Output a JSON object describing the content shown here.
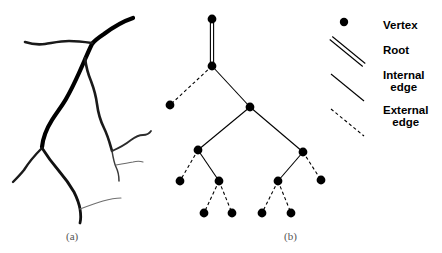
{
  "figure": {
    "panels": [
      {
        "id": "a",
        "label": "(a)",
        "caption_x": 78,
        "caption_y": 237,
        "content": "river-network-drawing"
      },
      {
        "id": "b",
        "label": "(b)",
        "caption_x": 296,
        "caption_y": 237,
        "content": "tree-diagram"
      }
    ]
  },
  "colors": {
    "ink": "#000000",
    "thin_ink": "#2b2b2b",
    "faint_ink": "#7a7a7a",
    "background": "#ffffff",
    "caption": "#555555"
  },
  "panel_a": {
    "name": "river-network",
    "strokes": [
      {
        "name": "main-trunk",
        "width": 4.2,
        "color": "#000000",
        "path": "M 133 18 C 124 21, 112 28, 104 34 C 98 38, 94 41, 92 44 C 88 52, 84 62, 79 73 C 74 84, 70 92, 66 99 C 62 106, 57 112, 52 120 C 47 128, 43 137, 42 147"
      },
      {
        "name": "upper-left-branch",
        "width": 2.6,
        "color": "#1a1a1a",
        "path": "M 92 43 C 85 42, 77 41, 69 41 C 60 41, 52 43, 45 44 C 38 45, 31 44, 25 42"
      },
      {
        "name": "right-secondary-branch",
        "width": 2.6,
        "color": "#1a1a1a",
        "path": "M 85 58 C 86 66, 88 74, 91 81 C 94 89, 96 96, 97 104 C 98 112, 100 120, 104 128 C 108 136, 110 144, 112 151"
      },
      {
        "name": "right-upper-twig",
        "width": 1.8,
        "color": "#2b2b2b",
        "path": "M 112 151 C 119 148, 126 144, 131 140 C 135 137, 139 135, 143 135 C 146 135, 149 134, 151 131"
      },
      {
        "name": "right-lower-twig",
        "width": 1.5,
        "color": "#3a3a3a",
        "path": "M 112 151 C 113 157, 114 163, 116 167 C 118 171, 119 176, 119 181"
      },
      {
        "name": "right-fine-twig",
        "width": 1.1,
        "color": "#6a6a6a",
        "path": "M 116 165 C 122 164, 128 163, 133 162 C 137 161, 140 161, 143 162"
      },
      {
        "name": "lower-left-branch",
        "width": 2.4,
        "color": "#1a1a1a",
        "path": "M 42 148 C 36 154, 29 162, 24 170 C 20 175, 16 179, 13 182"
      },
      {
        "name": "lower-main-stem",
        "width": 2.8,
        "color": "#111111",
        "path": "M 42 148 C 47 156, 53 164, 59 171 C 65 178, 70 185, 74 192 C 77 198, 79 203, 80 209 C 81 215, 81 219, 80 223"
      },
      {
        "name": "bottom-fine-twig",
        "width": 1.1,
        "color": "#6f6f6f",
        "path": "M 80 209 C 88 206, 96 203, 103 201 C 110 199, 116 198, 121 198"
      }
    ]
  },
  "panel_b": {
    "name": "tree-diagram",
    "vertex_radius": 4.4,
    "vertices": [
      {
        "id": "v0",
        "x": 212,
        "y": 19,
        "name": "root-top-vertex"
      },
      {
        "id": "v1",
        "x": 212,
        "y": 66,
        "name": "root-base-vertex"
      },
      {
        "id": "v2",
        "x": 170,
        "y": 105,
        "name": "external-leaf-left-top"
      },
      {
        "id": "v3",
        "x": 250,
        "y": 107,
        "name": "internal-vertex-center"
      },
      {
        "id": "v4",
        "x": 198,
        "y": 150,
        "name": "internal-vertex-left"
      },
      {
        "id": "v5",
        "x": 303,
        "y": 152,
        "name": "internal-vertex-right"
      },
      {
        "id": "v6",
        "x": 180,
        "y": 181,
        "name": "external-leaf-left-a"
      },
      {
        "id": "v7",
        "x": 219,
        "y": 181,
        "name": "internal-vertex-left-lower"
      },
      {
        "id": "v8",
        "x": 278,
        "y": 181,
        "name": "internal-vertex-right-lower"
      },
      {
        "id": "v9",
        "x": 321,
        "y": 180,
        "name": "external-leaf-right-a"
      },
      {
        "id": "v10",
        "x": 204,
        "y": 213,
        "name": "external-leaf-bottom-1"
      },
      {
        "id": "v11",
        "x": 232,
        "y": 213,
        "name": "external-leaf-bottom-2"
      },
      {
        "id": "v12",
        "x": 262,
        "y": 213,
        "name": "external-leaf-bottom-3"
      },
      {
        "id": "v13",
        "x": 291,
        "y": 213,
        "name": "external-leaf-bottom-4"
      }
    ],
    "edges": [
      {
        "from": "v0",
        "to": "v1",
        "type": "root",
        "name": "root-edge"
      },
      {
        "from": "v1",
        "to": "v2",
        "type": "external",
        "name": "external-edge-1"
      },
      {
        "from": "v1",
        "to": "v3",
        "type": "internal",
        "name": "internal-edge-1"
      },
      {
        "from": "v3",
        "to": "v4",
        "type": "internal",
        "name": "internal-edge-2"
      },
      {
        "from": "v3",
        "to": "v5",
        "type": "internal",
        "name": "internal-edge-3"
      },
      {
        "from": "v4",
        "to": "v6",
        "type": "external",
        "name": "external-edge-2"
      },
      {
        "from": "v4",
        "to": "v7",
        "type": "internal",
        "name": "internal-edge-4"
      },
      {
        "from": "v5",
        "to": "v8",
        "type": "internal",
        "name": "internal-edge-5"
      },
      {
        "from": "v5",
        "to": "v9",
        "type": "external",
        "name": "external-edge-3"
      },
      {
        "from": "v7",
        "to": "v10",
        "type": "external",
        "name": "external-edge-4"
      },
      {
        "from": "v7",
        "to": "v11",
        "type": "external",
        "name": "external-edge-5"
      },
      {
        "from": "v8",
        "to": "v12",
        "type": "external",
        "name": "external-edge-6"
      },
      {
        "from": "v8",
        "to": "v13",
        "type": "external",
        "name": "external-edge-7"
      }
    ]
  },
  "legend": {
    "name": "figure-legend",
    "text_left": 383,
    "items": [
      {
        "id": "vertex",
        "label": "Vertex",
        "symbol": "filled-dot",
        "text_x": 383,
        "text_y": 19,
        "marker": {
          "cx": 344,
          "cy": 22,
          "r": 4.2
        }
      },
      {
        "id": "root",
        "label": "Root",
        "symbol": "double-line",
        "text_x": 383,
        "text_y": 44,
        "marker": {
          "x1": 331,
          "y1": 38,
          "x2": 364,
          "y2": 65
        }
      },
      {
        "id": "internal-edge",
        "label": "Internal\nedge",
        "symbol": "single-line",
        "text_x": 383,
        "text_y": 69,
        "marker": {
          "x1": 331,
          "y1": 74,
          "x2": 364,
          "y2": 101
        }
      },
      {
        "id": "external-edge",
        "label": "External\nedge",
        "symbol": "dashed-line",
        "text_x": 383,
        "text_y": 104,
        "marker": {
          "x1": 331,
          "y1": 109,
          "x2": 364,
          "y2": 136
        }
      }
    ]
  }
}
